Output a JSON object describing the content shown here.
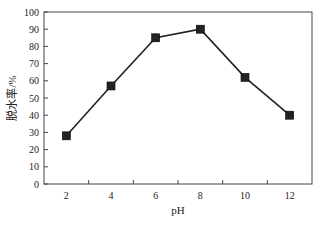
{
  "chart_data": {
    "type": "line",
    "title": "",
    "xlabel": "pH",
    "ylabel": "脱水率/%",
    "x": [
      2,
      4,
      6,
      8,
      10,
      12
    ],
    "series": [
      {
        "name": "脱水率",
        "values": [
          28,
          57,
          85,
          90,
          62,
          40
        ],
        "marker": "square",
        "color": "#222222"
      }
    ],
    "xlim": [
      1,
      13
    ],
    "ylim": [
      0,
      100
    ],
    "xticks": [
      2,
      4,
      6,
      8,
      10,
      12
    ],
    "xminor_ticks": [
      3,
      5,
      7,
      9,
      11
    ],
    "yticks": [
      0,
      10,
      20,
      30,
      40,
      50,
      60,
      70,
      80,
      90,
      100
    ],
    "grid": false,
    "legend": null
  }
}
